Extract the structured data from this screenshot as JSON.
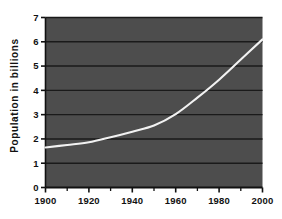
{
  "chart_data": {
    "type": "line",
    "title": "",
    "xlabel": "",
    "ylabel": "Population  in  billions",
    "xlim": [
      1900,
      2000
    ],
    "ylim": [
      0,
      7
    ],
    "grid": true,
    "legend": null,
    "background_color": "#4d4d4d",
    "line_color": "#f2f2f2",
    "gridline_color": "#1a1a1a",
    "axis_color": "#111111",
    "xticks": [
      1900,
      1920,
      1940,
      1960,
      1980,
      2000
    ],
    "xtick_labels": [
      "1900",
      "1920",
      "1940",
      "1960",
      "1980",
      "2000"
    ],
    "xminorticks": [
      1910,
      1930,
      1950,
      1970,
      1990
    ],
    "yticks": [
      0,
      1,
      2,
      3,
      4,
      5,
      6,
      7
    ],
    "ytick_labels": [
      "0",
      "1",
      "2",
      "3",
      "4",
      "5",
      "6",
      "7"
    ],
    "x": [
      1900,
      1910,
      1920,
      1930,
      1940,
      1950,
      1960,
      1970,
      1980,
      1990,
      2000
    ],
    "values": [
      1.65,
      1.75,
      1.86,
      2.07,
      2.3,
      2.55,
      3.02,
      3.7,
      4.44,
      5.27,
      6.1
    ],
    "series": [
      {
        "name": "World population",
        "values": [
          1.65,
          1.75,
          1.86,
          2.07,
          2.3,
          2.55,
          3.02,
          3.7,
          4.44,
          5.27,
          6.1
        ]
      }
    ]
  }
}
